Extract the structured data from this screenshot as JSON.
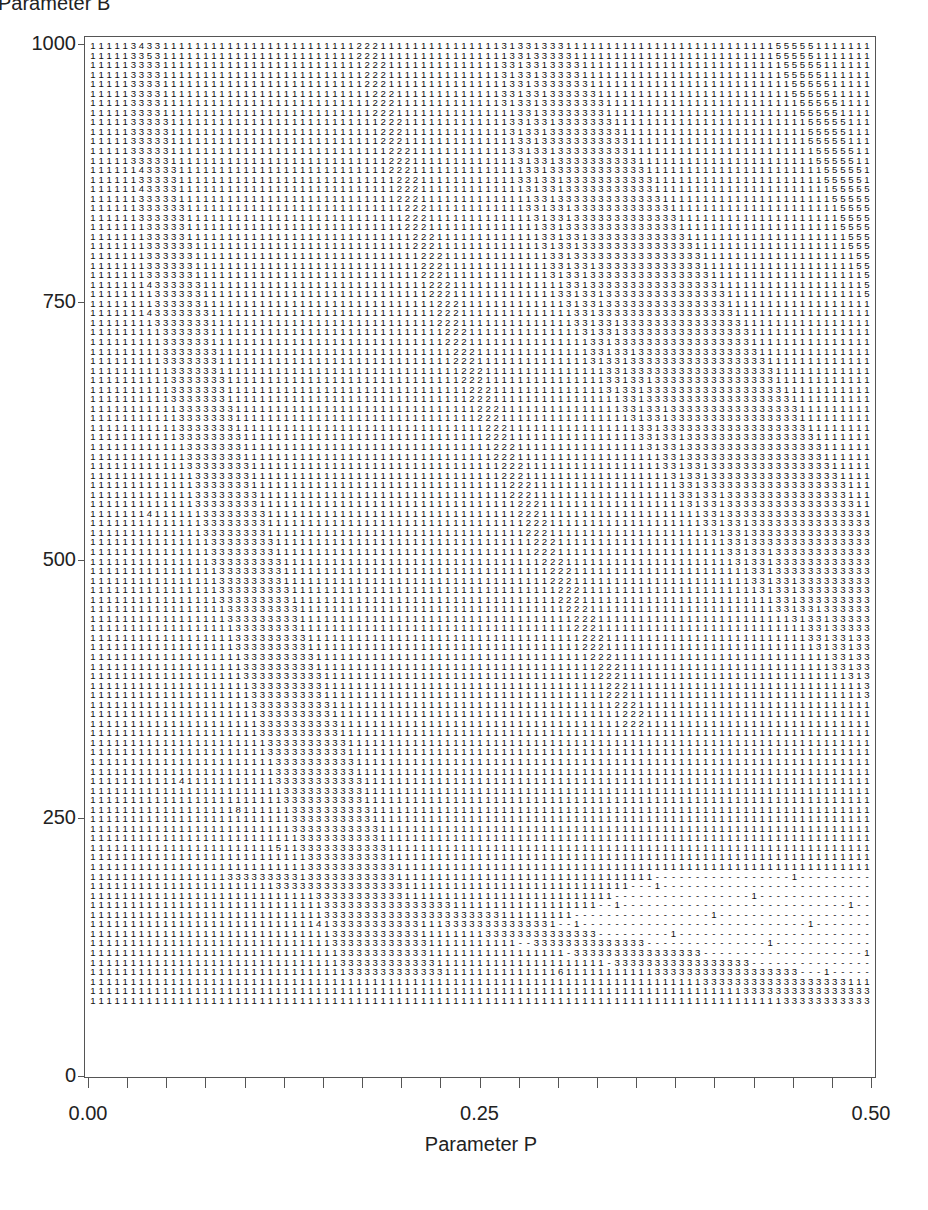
{
  "chart_data": {
    "type": "heatmap",
    "title": "",
    "xlabel": "Parameter P",
    "ylabel": "Parameter B",
    "xlim": [
      0.0,
      0.5
    ],
    "ylim": [
      0,
      1000
    ],
    "x_ticks": [
      "0.00",
      "0.25",
      "0.50"
    ],
    "y_ticks": [
      "0",
      "250",
      "500",
      "750",
      "1000"
    ],
    "x_minor_tick_count": 21,
    "grid": false,
    "legend": "none",
    "cell_symbols": [
      "1",
      "2",
      "3",
      "4",
      "5",
      "6",
      "8",
      "-"
    ],
    "columns": 97,
    "rows": 101,
    "regions": [
      {
        "code": "3",
        "name": "left-band",
        "p_start_at_B1000": 0.021,
        "p_start_at_B0": 0.17,
        "width_cols_top": 4,
        "width_cols_bottom": 12
      },
      {
        "code": "2",
        "name": "diagonal-band",
        "p_at_B1000": 0.17,
        "p_at_B300": 0.34,
        "width_cols": 3
      },
      {
        "code": "3",
        "name": "right-fan",
        "p_start_at_B1000": 0.26,
        "p_end_at_B1000": 0.305,
        "p_start_at_B300": 0.49,
        "p_end_at_B500": 0.5
      },
      {
        "code": "5",
        "name": "top-right-band",
        "p_at_B1000": 0.44,
        "p_at_B750": 0.5,
        "width_cols": 5
      },
      {
        "code": "-",
        "name": "bottom-right-dashed",
        "B_top_at_P_end": 130,
        "B_bottom": 30
      },
      {
        "code": "3",
        "name": "bottom-diagonal",
        "from": [
          0.11,
          130
        ],
        "to": [
          0.5,
          0
        ]
      }
    ],
    "sparse_marks": [
      {
        "code": "4",
        "p": 0.033,
        "B": 1000
      },
      {
        "code": "5",
        "p": 0.034,
        "B": 990
      },
      {
        "code": "4",
        "p": 0.033,
        "B": 870
      },
      {
        "code": "4",
        "p": 0.033,
        "B": 850
      },
      {
        "code": "4",
        "p": 0.034,
        "B": 750
      },
      {
        "code": "4",
        "p": 0.036,
        "B": 725
      },
      {
        "code": "4",
        "p": 0.036,
        "B": 510
      },
      {
        "code": "4",
        "p": 0.059,
        "B": 235
      },
      {
        "code": "8",
        "p": 0.094,
        "B": 200
      },
      {
        "code": "5",
        "p": 0.12,
        "B": 165
      },
      {
        "code": "4",
        "p": 0.145,
        "B": 85
      },
      {
        "code": "6",
        "p": 0.3,
        "B": 28
      }
    ]
  }
}
